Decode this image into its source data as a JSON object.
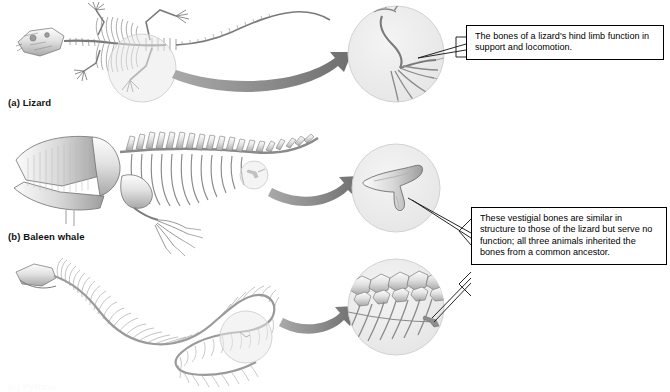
{
  "figure": {
    "background_color": "#ffffff"
  },
  "specimens": [
    {
      "id": "lizard",
      "label": "(a) Lizard",
      "description": "Full lizard skeleton in dorsal view with highlighted hind limb region"
    },
    {
      "id": "baleen-whale",
      "label": "(b) Baleen whale",
      "description": "Baleen whale skeleton in lateral view with highlighted vestigial pelvic bone"
    },
    {
      "id": "snake",
      "label": "(c) Python",
      "description": "Snake skeleton coiled, with highlighted vestigial pelvic spur region"
    }
  ],
  "insets": [
    {
      "id": "lizard-hindlimb",
      "name": "lizard-hind-limb-inset",
      "content": "Magnified lizard hind limb showing femur, tibia, fibula and digits"
    },
    {
      "id": "whale-pelvic",
      "name": "whale-pelvic-bone-inset",
      "content": "Magnified three-pronged vestigial pelvic bone of the baleen whale"
    },
    {
      "id": "snake-pelvic",
      "name": "snake-pelvic-spur-inset",
      "content": "Magnified snake vertebrae and ribs showing a small vestigial pelvic spur"
    }
  ],
  "callouts": [
    {
      "id": "lizard-function",
      "text": "The bones of a lizard's hind limb function in support and locomotion."
    },
    {
      "id": "vestigial-explanation",
      "text": "These vestigial bones are similar in structure to those of the lizard but serve no function; all three animals inherited the bones from a common ancestor."
    }
  ],
  "colors": {
    "bone_light": "#f3f3f3",
    "bone_mid": "#c9c9c9",
    "bone_dark": "#8d8d8d",
    "outline": "#6f6f6f",
    "inset_fill": "#ededed",
    "inset_stroke": "#d2d2d2",
    "arrow": "#8a8a8a",
    "leader": "#1a1a1a",
    "text": "#000000"
  }
}
